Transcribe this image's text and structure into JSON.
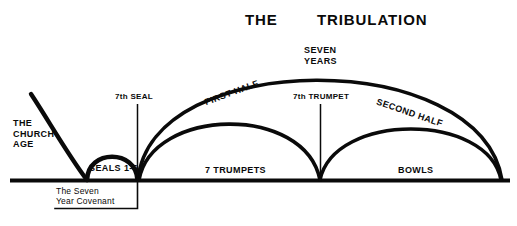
{
  "diagram": {
    "title_part_1": "THE",
    "title_part_2": "TRIBULATION",
    "labels": {
      "church_age": "THE\nCHURCH\nAGE",
      "seals": "SEALS 1-6",
      "seventh_seal": "7th SEAL",
      "seven_year_covenant": "The Seven\nYear Covenant",
      "first_half": "FIRST HALF",
      "second_half": "SECOND HALF",
      "seven_years": "SEVEN\nYEARS",
      "seventh_trumpet": "7th TRUMPET",
      "seven_trumpets": "7 TRUMPETS",
      "bowls": "BOWLS"
    },
    "colors": {
      "ink": "#0a0a0a",
      "background": "#ffffff"
    }
  }
}
